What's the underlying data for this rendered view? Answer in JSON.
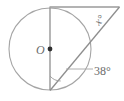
{
  "figure": {
    "type": "circle-geometry-diagram",
    "background_color": "#ffffff",
    "stroke_color": "#9a9a9a",
    "text_color": "#6b6b6b",
    "center_label": "O",
    "angle_apex_label": "x°",
    "angle_vertex_label": "38°",
    "circle": {
      "center_x": 50,
      "center_y": 49,
      "radius": 41
    },
    "points": {
      "top": {
        "x": 50,
        "y": 8
      },
      "bottom": {
        "x": 50,
        "y": 90
      },
      "apex": {
        "x": 119,
        "y": 7
      },
      "center_dot": {
        "x": 50,
        "y": 49
      }
    },
    "segments": [
      {
        "name": "vertical-diameter",
        "x1": 50,
        "y1": 8,
        "x2": 50,
        "y2": 90
      },
      {
        "name": "top-horizontal-tangent",
        "x1": 50,
        "y1": 7,
        "x2": 119,
        "y2": 7
      },
      {
        "name": "secant-diagonal",
        "x1": 119,
        "y1": 7,
        "x2": 50,
        "y2": 90
      },
      {
        "name": "leader-line-38",
        "x1": 68,
        "y1": 69,
        "x2": 95,
        "y2": 69
      }
    ],
    "angle_marks": [
      {
        "name": "angle-arc-bottom-vertex",
        "cx": 50,
        "cy": 90,
        "r": 14
      }
    ],
    "labels": [
      {
        "name": "center-label-O",
        "text": "O",
        "x": 37,
        "y": 54,
        "rotation": 0,
        "italic": true,
        "size": 11
      },
      {
        "name": "apex-angle-label-x",
        "text": "x°",
        "x": 99,
        "y": 25,
        "rotation": -48,
        "italic": true,
        "size": 11
      },
      {
        "name": "vertex-angle-label-38",
        "text": "38°",
        "x": 95,
        "y": 75,
        "rotation": 0,
        "italic": false,
        "size": 12
      }
    ]
  }
}
